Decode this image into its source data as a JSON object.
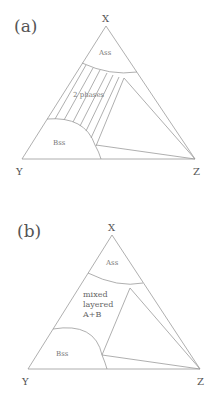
{
  "panels": [
    {
      "label": "(a)",
      "vertices": {
        "top": "X",
        "left": "Y",
        "right": "Z"
      },
      "regions": {
        "a_solid_solution": "Ass",
        "b_solid_solution": "Bss",
        "two_phase": "2 phases"
      },
      "tie_line_count": 6
    },
    {
      "label": "(b)",
      "vertices": {
        "top": "X",
        "left": "Y",
        "right": "Z"
      },
      "regions": {
        "a_solid_solution": "Ass",
        "b_solid_solution": "Bss",
        "mixed_line1": "mixed",
        "mixed_line2": "layered",
        "mixed_line3": "A+B"
      }
    }
  ]
}
